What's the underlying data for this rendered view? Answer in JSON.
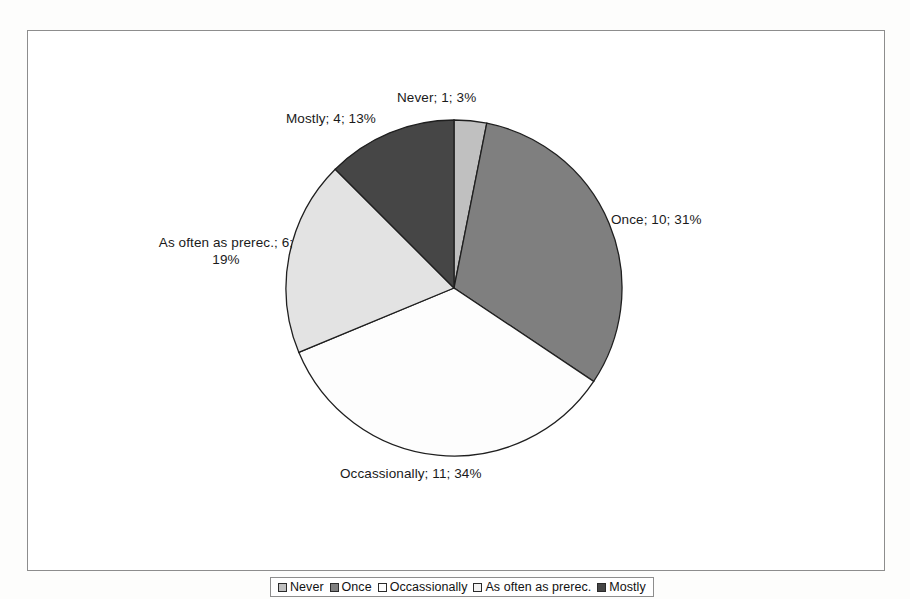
{
  "chart_data": {
    "type": "pie",
    "title": "",
    "categories": [
      "Never",
      "Once",
      "Occassionally",
      "As often as prerec.",
      "Mostly"
    ],
    "values": [
      1,
      10,
      11,
      6,
      4
    ],
    "percents": [
      3,
      31,
      34,
      19,
      13
    ],
    "total": 32,
    "slice_colors": [
      "#c0c0c0",
      "#7f7f7f",
      "#fdfdfd",
      "#e3e3e3",
      "#464646"
    ],
    "slice_order_clockwise_from_12": [
      "Never",
      "Once",
      "Occassionally",
      "As often as prerec.",
      "Mostly"
    ],
    "legend_position": "bottom",
    "grid": false,
    "data_labels": [
      "Never; 1; 3%",
      "Once; 10; 31%",
      "Occassionally; 11; 34%",
      "As often as prerec.; 6; 19%",
      "Mostly; 4; 13%"
    ]
  },
  "labels": {
    "never": "Never; 1; 3%",
    "once": "Once; 10; 31%",
    "occassionally": "Occassionally; 11; 34%",
    "as_often_line1": "As often as prerec.; 6;",
    "as_often_line2": "19%",
    "mostly": "Mostly; 4; 13%"
  },
  "legend": {
    "items": [
      {
        "label": "Never",
        "color": "#c0c0c0"
      },
      {
        "label": "Once",
        "color": "#7f7f7f"
      },
      {
        "label": "Occassionally",
        "color": "#fdfdfd"
      },
      {
        "label": "As often as prerec.",
        "color": "#f2f2f2"
      },
      {
        "label": "Mostly",
        "color": "#464646"
      }
    ]
  },
  "style": {
    "frame_border": "#8d8d8d",
    "slice_outline": "#1f1f1f",
    "text_color": "#1a1a1a"
  }
}
